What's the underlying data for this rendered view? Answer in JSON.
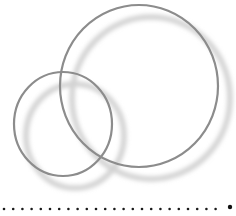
{
  "illustration": {
    "description": "Two overlapping outlined circles with soft offset shadows",
    "colors": {
      "background": "#ffffff",
      "ring": "#8c8c8c",
      "shadow": "#cfcfcf",
      "dot": "#1a1a1a"
    },
    "circles": [
      {
        "name": "large-ring",
        "cx": 139,
        "cy": 86,
        "rx": 79,
        "ry": 81
      },
      {
        "name": "small-ring",
        "cx": 63,
        "cy": 124,
        "rx": 49,
        "ry": 52
      }
    ],
    "shadow_offset": {
      "dx": 12,
      "dy": 12
    }
  },
  "divider": {
    "style": "dotted",
    "dot_count": 24,
    "end_dot": true
  }
}
